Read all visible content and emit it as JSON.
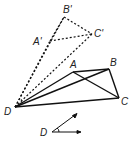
{
  "diagram": {
    "type": "geometry-rotation",
    "center": {
      "label": "D",
      "x": 15,
      "y": 107
    },
    "original": {
      "A": {
        "label": "A",
        "x": 73,
        "y": 72
      },
      "B": {
        "label": "B",
        "x": 109,
        "y": 69
      },
      "C": {
        "label": "C",
        "x": 119,
        "y": 98
      }
    },
    "image": {
      "A": {
        "label": "A'",
        "x": 50,
        "y": 41
      },
      "B": {
        "label": "B'",
        "x": 64,
        "y": 17
      },
      "C": {
        "label": "C'",
        "x": 92,
        "y": 34
      }
    },
    "angle": {
      "label": "D",
      "vx": 52,
      "vy": 132,
      "r1x": 80,
      "r1y": 132,
      "r2x": 77,
      "r2y": 113
    }
  }
}
